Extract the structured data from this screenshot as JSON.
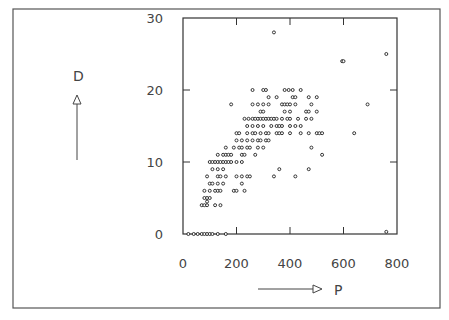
{
  "chart_data": {
    "type": "scatter",
    "title": "",
    "xlabel": "P",
    "ylabel": "D",
    "xlim": [
      0,
      800
    ],
    "ylim": [
      0,
      30
    ],
    "xticks": [
      0,
      200,
      400,
      600,
      800
    ],
    "yticks": [
      0,
      10,
      20,
      30
    ],
    "xtick_labels": [
      "0",
      "200",
      "400",
      "600",
      "800"
    ],
    "ytick_labels": [
      "0",
      "10",
      "20",
      "30"
    ],
    "grid": false,
    "legend": null,
    "marker": "small open circle",
    "series": [
      {
        "name": "P vs D",
        "points": [
          [
            340,
            28
          ],
          [
            760,
            25
          ],
          [
            595,
            24
          ],
          [
            600,
            24
          ],
          [
            690,
            18
          ],
          [
            520,
            11
          ],
          [
            420,
            8
          ],
          [
            640,
            14
          ],
          [
            470,
            9
          ],
          [
            760,
            0.3
          ],
          [
            260,
            20
          ],
          [
            300,
            20
          ],
          [
            310,
            20
          ],
          [
            380,
            20
          ],
          [
            395,
            20
          ],
          [
            410,
            20
          ],
          [
            440,
            20
          ],
          [
            470,
            19
          ],
          [
            180,
            18
          ],
          [
            260,
            18
          ],
          [
            280,
            18
          ],
          [
            300,
            18
          ],
          [
            320,
            18
          ],
          [
            370,
            18
          ],
          [
            380,
            18
          ],
          [
            390,
            18
          ],
          [
            400,
            18
          ],
          [
            420,
            18
          ],
          [
            480,
            18
          ],
          [
            320,
            19
          ],
          [
            350,
            19
          ],
          [
            410,
            19
          ],
          [
            420,
            19
          ],
          [
            500,
            19
          ],
          [
            290,
            17
          ],
          [
            300,
            17
          ],
          [
            380,
            17
          ],
          [
            400,
            17
          ],
          [
            460,
            17
          ],
          [
            470,
            17
          ],
          [
            500,
            17
          ],
          [
            230,
            16
          ],
          [
            245,
            16
          ],
          [
            260,
            16
          ],
          [
            270,
            16
          ],
          [
            280,
            16
          ],
          [
            290,
            16
          ],
          [
            300,
            16
          ],
          [
            310,
            16
          ],
          [
            320,
            16
          ],
          [
            330,
            16
          ],
          [
            340,
            16
          ],
          [
            350,
            16
          ],
          [
            370,
            16
          ],
          [
            390,
            16
          ],
          [
            400,
            16
          ],
          [
            430,
            16
          ],
          [
            460,
            16
          ],
          [
            480,
            16
          ],
          [
            240,
            15
          ],
          [
            260,
            15
          ],
          [
            280,
            15
          ],
          [
            300,
            15
          ],
          [
            330,
            15
          ],
          [
            350,
            15
          ],
          [
            360,
            15
          ],
          [
            370,
            15
          ],
          [
            400,
            15
          ],
          [
            420,
            15
          ],
          [
            440,
            15
          ],
          [
            200,
            14
          ],
          [
            210,
            14
          ],
          [
            240,
            14
          ],
          [
            260,
            14
          ],
          [
            270,
            14
          ],
          [
            290,
            14
          ],
          [
            310,
            14
          ],
          [
            320,
            14
          ],
          [
            350,
            14
          ],
          [
            360,
            14
          ],
          [
            370,
            14
          ],
          [
            400,
            14
          ],
          [
            440,
            14
          ],
          [
            470,
            14
          ],
          [
            500,
            14
          ],
          [
            510,
            14
          ],
          [
            520,
            14
          ],
          [
            200,
            13
          ],
          [
            220,
            13
          ],
          [
            240,
            13
          ],
          [
            260,
            13
          ],
          [
            280,
            13
          ],
          [
            290,
            13
          ],
          [
            310,
            13
          ],
          [
            320,
            13
          ],
          [
            160,
            12
          ],
          [
            190,
            12
          ],
          [
            210,
            12
          ],
          [
            220,
            12
          ],
          [
            240,
            12
          ],
          [
            250,
            12
          ],
          [
            280,
            12
          ],
          [
            300,
            12
          ],
          [
            480,
            12
          ],
          [
            130,
            11
          ],
          [
            150,
            11
          ],
          [
            160,
            11
          ],
          [
            170,
            11
          ],
          [
            180,
            11
          ],
          [
            220,
            11
          ],
          [
            230,
            11
          ],
          [
            270,
            11
          ],
          [
            100,
            10
          ],
          [
            110,
            10
          ],
          [
            120,
            10
          ],
          [
            130,
            10
          ],
          [
            140,
            10
          ],
          [
            150,
            10
          ],
          [
            160,
            10
          ],
          [
            170,
            10
          ],
          [
            180,
            10
          ],
          [
            200,
            10
          ],
          [
            220,
            10
          ],
          [
            110,
            9
          ],
          [
            130,
            9
          ],
          [
            150,
            9
          ],
          [
            360,
            9
          ],
          [
            90,
            8
          ],
          [
            130,
            8
          ],
          [
            140,
            8
          ],
          [
            160,
            8
          ],
          [
            200,
            8
          ],
          [
            220,
            8
          ],
          [
            240,
            8
          ],
          [
            250,
            8
          ],
          [
            340,
            8
          ],
          [
            100,
            7
          ],
          [
            110,
            7
          ],
          [
            130,
            7
          ],
          [
            150,
            7
          ],
          [
            220,
            7
          ],
          [
            80,
            6
          ],
          [
            100,
            6
          ],
          [
            120,
            6
          ],
          [
            130,
            6
          ],
          [
            140,
            6
          ],
          [
            190,
            6
          ],
          [
            200,
            6
          ],
          [
            230,
            6
          ],
          [
            80,
            5
          ],
          [
            90,
            5
          ],
          [
            100,
            5
          ],
          [
            90,
            4.5
          ],
          [
            70,
            4
          ],
          [
            80,
            4
          ],
          [
            90,
            4
          ],
          [
            120,
            4
          ],
          [
            140,
            4
          ],
          [
            20,
            0
          ],
          [
            40,
            0
          ],
          [
            55,
            0
          ],
          [
            70,
            0
          ],
          [
            80,
            0
          ],
          [
            90,
            0
          ],
          [
            100,
            0
          ],
          [
            110,
            0
          ],
          [
            130,
            0
          ],
          [
            160,
            0
          ]
        ]
      }
    ]
  },
  "figure": {
    "y_axis_name": "D",
    "x_axis_name": "P"
  }
}
